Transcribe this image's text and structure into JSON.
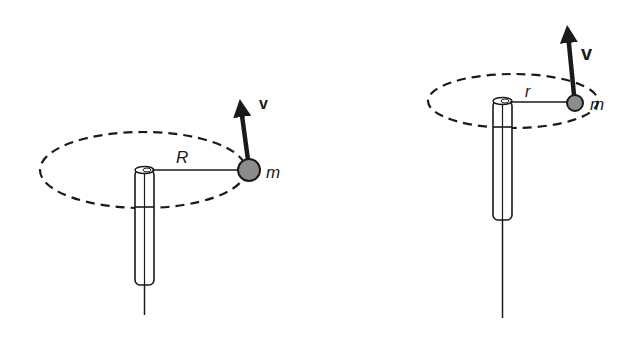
{
  "diagram": {
    "colors": {
      "ink": "#1a1a1a",
      "ball_fill": "#8c8c8c",
      "background": "#ffffff"
    },
    "left": {
      "radius_label": "R",
      "mass_label": "m",
      "velocity_label": "v"
    },
    "right": {
      "radius_label": "r",
      "mass_label": "m",
      "velocity_label": "v"
    }
  }
}
